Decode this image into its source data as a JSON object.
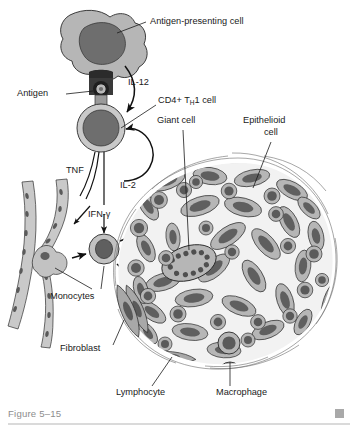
{
  "figure": {
    "caption": "Figure 5–15",
    "caption_marker": "square-marker",
    "background_color": "#ffffff"
  },
  "palette": {
    "cytoplasm": "#b6b6b6",
    "cytoplasm_light": "#c9c9c9",
    "nucleus": "#6e6e6e",
    "nucleus_dark": "#5a5a5a",
    "outline": "#2a2a2a",
    "mhc_stalk": "#3a3a3a",
    "caption_gray": "#8d8d8d",
    "rule_gray": "#b5b5b5",
    "wisp_gray": "#6b6b6b",
    "label_text": "#1a1a1a"
  },
  "labels": [
    {
      "id": "antigen-presenting-cell",
      "text": "Antigen-presenting cell",
      "x": 150,
      "y": 22,
      "anchor": "start"
    },
    {
      "id": "antigen",
      "text": "Antigen",
      "x": 17,
      "y": 94,
      "anchor": "start"
    },
    {
      "id": "il-12",
      "text": "IL-12",
      "x": 128,
      "y": 83,
      "anchor": "start"
    },
    {
      "id": "cd4-th1-cell",
      "text": "CD4+ T",
      "text_sub": "H",
      "text_tail": "1 cell",
      "x": 158,
      "y": 101,
      "anchor": "start"
    },
    {
      "id": "giant-cell",
      "text": "Giant cell",
      "x": 157,
      "y": 121,
      "anchor": "start"
    },
    {
      "id": "epithelioid-cell-line1",
      "text": "Epithelioid",
      "x": 243,
      "y": 121,
      "anchor": "start"
    },
    {
      "id": "epithelioid-cell-line2",
      "text": "cell",
      "x": 264,
      "y": 133,
      "anchor": "start"
    },
    {
      "id": "tnf",
      "text": "TNF",
      "x": 66,
      "y": 171,
      "anchor": "start"
    },
    {
      "id": "il-2",
      "text": "IL-2",
      "x": 120,
      "y": 186,
      "anchor": "start"
    },
    {
      "id": "ifn-gamma",
      "text": "IFN-γ",
      "x": 88,
      "y": 215,
      "anchor": "start"
    },
    {
      "id": "monocytes",
      "text": "Monocytes",
      "x": 50,
      "y": 297,
      "anchor": "start"
    },
    {
      "id": "fibroblast",
      "text": "Fibroblast",
      "x": 60,
      "y": 349,
      "anchor": "start"
    },
    {
      "id": "lymphocyte",
      "text": "Lymphocyte",
      "x": 116,
      "y": 393,
      "anchor": "start"
    },
    {
      "id": "macrophage",
      "text": "Macrophage",
      "x": 216,
      "y": 393,
      "anchor": "start"
    }
  ],
  "cytokines": [
    {
      "name": "IL-12",
      "from": "antigen-presenting-cell",
      "to": "cd4-th1-cell"
    },
    {
      "name": "IL-2",
      "from": "cd4-th1-cell",
      "to": "cd4-th1-cell"
    },
    {
      "name": "TNF",
      "from": "cd4-th1-cell",
      "to": "blood-vessel"
    },
    {
      "name": "IFN-γ",
      "from": "cd4-th1-cell",
      "to": "monocyte"
    }
  ],
  "structures": [
    {
      "id": "antigen-presenting-cell",
      "kind": "amoeboid-cell"
    },
    {
      "id": "mhc-antigen-complex",
      "kind": "receptor-stalk"
    },
    {
      "id": "cd4-th1-cell",
      "kind": "round-cell"
    },
    {
      "id": "blood-vessel",
      "kind": "vessel"
    },
    {
      "id": "monocyte",
      "kind": "round-cell"
    },
    {
      "id": "granuloma",
      "kind": "cell-mass"
    },
    {
      "id": "giant-cell",
      "kind": "multinucleated-cell",
      "nuclei_count": 12
    },
    {
      "id": "epithelioid-cell",
      "kind": "elongated-cell"
    },
    {
      "id": "fibroblast",
      "kind": "spindle-cell"
    },
    {
      "id": "lymphocyte",
      "kind": "small-round-cell"
    },
    {
      "id": "macrophage",
      "kind": "round-cell"
    }
  ]
}
